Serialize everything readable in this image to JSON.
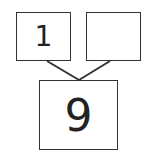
{
  "diagram": {
    "type": "number-bond",
    "parts": [
      {
        "position": "top-left",
        "value": "1"
      },
      {
        "position": "top-right",
        "value": ""
      }
    ],
    "whole": {
      "position": "bottom",
      "value": "9"
    }
  }
}
